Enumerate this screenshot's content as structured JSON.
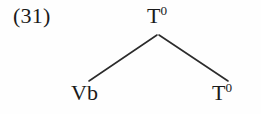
{
  "figure": {
    "kind": "syntax-tree",
    "example_number": "(31)",
    "background_color": "#fefefe",
    "ink_color": "#1a1a1a",
    "branch_color": "#2b2b2b",
    "branch_width": 1.6
  },
  "tree": {
    "root": {
      "label_text": "T",
      "superscript": "0",
      "full_label": "T0",
      "x": 158,
      "y": 18
    },
    "daughters": [
      {
        "label_text": "Vb",
        "superscript": "",
        "full_label": "Vb",
        "x": 90,
        "y": 94
      },
      {
        "label_text": "T",
        "superscript": "0",
        "full_label": "T0",
        "x": 227,
        "y": 94
      }
    ],
    "branches": [
      {
        "name": "left-branch",
        "x1": 157,
        "y1": 35,
        "x2": 89,
        "y2": 81
      },
      {
        "name": "right-branch",
        "x1": 159,
        "y1": 35,
        "x2": 228,
        "y2": 81
      }
    ]
  }
}
